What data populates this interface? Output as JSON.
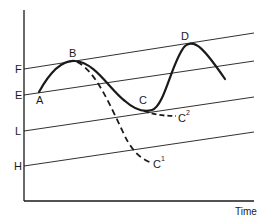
{
  "diagram": {
    "type": "line-diagram",
    "x_axis_label": "Time",
    "y_axis_labels": [
      "F",
      "E",
      "L",
      "H"
    ],
    "reference_lines": [
      {
        "label": "F",
        "x1": 24,
        "y1": 69,
        "x2": 254,
        "y2": 33
      },
      {
        "label": "E",
        "x1": 24,
        "y1": 95,
        "x2": 254,
        "y2": 61
      },
      {
        "label": "L",
        "x1": 24,
        "y1": 131,
        "x2": 254,
        "y2": 97
      },
      {
        "label": "H",
        "x1": 24,
        "y1": 166,
        "x2": 254,
        "y2": 132
      }
    ],
    "points": {
      "A": "A",
      "B": "B",
      "C": "C",
      "D": "D"
    },
    "branches": {
      "c1_base": "C",
      "c1_sup": "1",
      "c2_base": "C",
      "c2_sup": "2"
    },
    "colors": {
      "ink": "#1a1a1a",
      "background": "#ffffff"
    }
  }
}
